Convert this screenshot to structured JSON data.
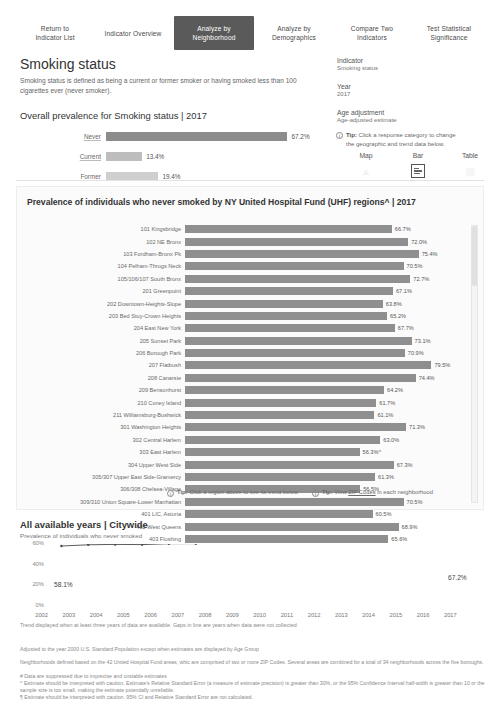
{
  "tabs": [
    {
      "label": "Return to\nIndicator List",
      "active": false
    },
    {
      "label": "Indicator Overview",
      "active": false
    },
    {
      "label": "Analyze by\nNeighborhood",
      "active": true
    },
    {
      "label": "Analyze by\nDemographics",
      "active": false
    },
    {
      "label": "Compare Two\nIndicators",
      "active": false
    },
    {
      "label": "Test Statistical\nSignificance",
      "active": false
    }
  ],
  "header": {
    "title": "Smoking status",
    "description": "Smoking status is defined as being a current or former smoker or having smoked less than 100 cigarettes ever (never smoker)."
  },
  "meta": {
    "indicator_label": "Indicator",
    "indicator_value": "Smoking status",
    "year_label": "Year",
    "year_value": "2017",
    "age_label": "Age adjustment",
    "age_value": "Age-adjusted estimate"
  },
  "tip_panel": {
    "prefix": "Tip:",
    "line1": "Click a response category to change",
    "line2": "the geographic and trend data below.",
    "icon": "info-icon"
  },
  "view_tabs": [
    {
      "label": "Map",
      "icon": "map-icon",
      "selected": false
    },
    {
      "label": "Bar",
      "icon": "bar-icon",
      "selected": true
    },
    {
      "label": "Table",
      "icon": "table-icon",
      "selected": false
    }
  ],
  "overall": {
    "heading": "Overall prevalence for Smoking status | 2017",
    "chart_data": {
      "type": "bar",
      "title": "Overall prevalence for Smoking status | 2017",
      "xlabel": "",
      "ylabel": "",
      "orientation": "horizontal",
      "categories": [
        "Never",
        "Current",
        "Former"
      ],
      "values": [
        67.2,
        13.4,
        19.4
      ],
      "labels": [
        "67.2%",
        "13.4%",
        "19.4%"
      ],
      "xlim": [
        0,
        100
      ],
      "grid": false,
      "legend": "none"
    }
  },
  "uhf": {
    "title": "Prevalence of individuals who never smoked  by NY United Hospital Fund (UHF) regions^ | 2017",
    "tip1_prefix": "Tip:",
    "tip1": "Click a region above to see its trend below",
    "tip2_prefix": "Tip:",
    "tip2_pre": "View",
    "tip2_link": "ZIP Codes",
    "tip2_post": "in each neighborhood",
    "chart_data": {
      "type": "bar",
      "title": "Prevalence of individuals who never smoked by NY United Hospital Fund (UHF) regions^ | 2017",
      "orientation": "horizontal",
      "xlabel": "",
      "ylabel": "",
      "xlim": [
        0,
        100
      ],
      "grid": false,
      "legend": "none",
      "categories": [
        "101 Kingsbridge",
        "102 NE Bronx",
        "103 Fordham-Bronx Pk",
        "104 Pelham-Throgs Neck",
        "105/106/107 South Bronx",
        "201 Greenpoint",
        "202 Downtown-Heights-Slope",
        "203 Bed Stuy-Crown Heights",
        "204 East New York",
        "205 Sunset Park",
        "206 Borough Park",
        "207 Flatbush",
        "208 Canarsie",
        "209 Bensonhurst",
        "210 Coney Island",
        "211 Williamsburg-Bushwick",
        "301 Washington Heights",
        "302 Central Harlem",
        "303 East Harlem",
        "304 Upper West Side",
        "305/307 Upper East Side-Gramercy",
        "306/308 Chelsea-Village",
        "309/310 Union Square-Lower Manhattan",
        "401 LIC, Astoria",
        "402 West Queens",
        "403 Flushing"
      ],
      "values": [
        66.7,
        72.0,
        75.4,
        70.5,
        72.7,
        67.1,
        63.8,
        65.2,
        67.7,
        73.1,
        70.9,
        79.5,
        74.4,
        64.2,
        61.7,
        61.1,
        71.3,
        63.0,
        56.3,
        67.3,
        61.3,
        56.5,
        70.5,
        60.5,
        68.9,
        65.6
      ],
      "labels": [
        "66.7%",
        "72.0%",
        "75.4%",
        "70.5%",
        "72.7%",
        "67.1%",
        "63.8%",
        "65.2%",
        "67.7%",
        "73.1%",
        "70.9%",
        "79.5%",
        "74.4%",
        "64.2%",
        "61.7%",
        "61.1%",
        "71.3%",
        "63.0%",
        "56.3%^",
        "67.3%",
        "61.3%",
        "56.5%",
        "70.5%",
        "60.5%",
        "68.9%",
        "65.6%"
      ]
    }
  },
  "trend": {
    "heading": "All available years | Citywide",
    "subheading": "Prevalence of individuals who never smoked",
    "note": "Trend displayed when at least three years of data are available. Gaps in line are years when data were not collected",
    "chart_data": {
      "type": "line",
      "title": "All available years | Citywide",
      "subtitle": "Prevalence of individuals who never smoked",
      "xlabel": "",
      "ylabel": "",
      "ylim": [
        0,
        60
      ],
      "yticks": [
        "0%",
        "20%",
        "40%",
        "60%"
      ],
      "grid": false,
      "legend": "none",
      "x": [
        "2002",
        "2003",
        "2004",
        "2005",
        "2006",
        "2007",
        "2008",
        "2009",
        "2010",
        "2011",
        "2012",
        "2013",
        "2014",
        "2015",
        "2016",
        "2017"
      ],
      "values": [
        58.1,
        59.2,
        59.6,
        59.4,
        60.3,
        60.4,
        61.5,
        61.4,
        62.4,
        63.0,
        63.8,
        62.9,
        64.0,
        65.2,
        66.2,
        67.2
      ],
      "first_label": "58.1%",
      "last_label": "67.2%"
    }
  },
  "footnotes": {
    "f0": "Adjusted to the year 2000 U.S. Standard Population except when estimates are displayed by Age Group",
    "f1": "Neighborhoods defined based on the 42 United Hospital Fund areas, whic are comprised of two or more ZIP Codes. Several areas are combined for a total of 34 neighborhoods across the five boroughs.",
    "f2": "# Data are suppressed due to imprecise and unstable estimates",
    "f3": "^ Estimate should be interpreted with caution. Estimate's Relative Standard Error (a measure of estimate precision) is greater than 30%, or the 95% Confidence Interval half-width is greater than 10 or the sample size is too small, making the estimate potentially unreliable.",
    "f4": "¶ Estimate should be interpreted with caution. 95% CI and Relative Standard Error are not calculated."
  }
}
